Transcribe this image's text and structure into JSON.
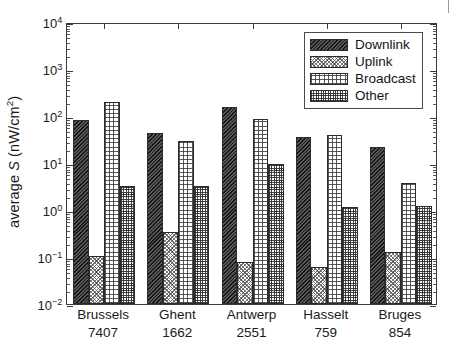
{
  "chart_data": {
    "type": "bar",
    "title": "",
    "xlabel": "",
    "ylabel": "average S (nW/cm2)",
    "ylabel_parts": {
      "prefix": "average ",
      "symbol": "S",
      "unit_open": " (nW/cm",
      "unit_exp": "2",
      "unit_close": ")"
    },
    "yscale": "log",
    "ylim": [
      0.01,
      10000
    ],
    "grid": false,
    "legend_position": "top-right",
    "categories": [
      "Brussels",
      "Ghent",
      "Antwerp",
      "Hasselt",
      "Bruges"
    ],
    "category_counts": [
      "7407",
      "1662",
      "2551",
      "759",
      "854"
    ],
    "ytick_labels": [
      "10-2",
      "10-1",
      "100",
      "101",
      "102",
      "103",
      "104"
    ],
    "ytick_mantissa": "10",
    "ytick_exponents": [
      "-2",
      "-1",
      "0",
      "1",
      "2",
      "3",
      "4"
    ],
    "ytick_values": [
      0.01,
      0.1,
      1,
      10,
      100,
      1000,
      10000
    ],
    "series": [
      {
        "name": "Downlink",
        "pattern": "dark-diagonal-hatch",
        "color": "#4a4a4a",
        "values": [
          83,
          44,
          155,
          35,
          22
        ]
      },
      {
        "name": "Uplink",
        "pattern": "light-stipple",
        "color": "#d8d8d8",
        "values": [
          0.105,
          0.34,
          0.08,
          0.062,
          0.13
        ]
      },
      {
        "name": "Broadcast",
        "pattern": "open-grid",
        "color": "#ffffff",
        "values": [
          200,
          30,
          88,
          40,
          3.8
        ]
      },
      {
        "name": "Other",
        "pattern": "dense-dotted-grid",
        "color": "#ffffff",
        "values": [
          3.2,
          3.3,
          9.3,
          1.15,
          1.2
        ]
      }
    ]
  },
  "legend": {
    "entries": [
      {
        "label": "Downlink"
      },
      {
        "label": "Uplink"
      },
      {
        "label": "Broadcast"
      },
      {
        "label": "Other"
      }
    ]
  }
}
